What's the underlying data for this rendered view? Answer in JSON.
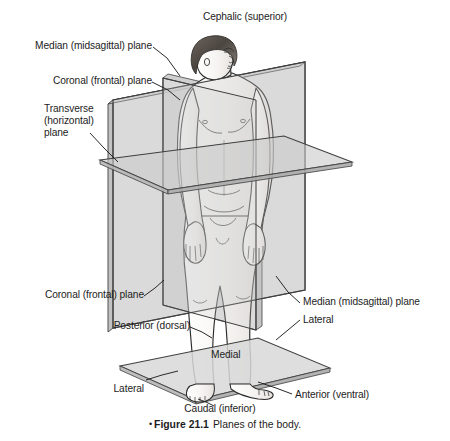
{
  "figure": {
    "caption_bullet": "•",
    "caption_number": "Figure 21.1",
    "caption_text": "Planes of the body."
  },
  "labels": {
    "cephalic": "Cephalic (superior)",
    "median_plane_top": "Median (midsagittal) plane",
    "coronal_plane_top": "Coronal (frontal) plane",
    "transverse_line1": "Transverse",
    "transverse_line2": "(horizontal)",
    "transverse_line3": "plane",
    "coronal_plane_bottom": "Coronal (frontal) plane",
    "median_plane_bottom": "Median (midsagittal) plane",
    "posterior": "Posterior (dorsal)",
    "lateral_right": "Lateral",
    "lateral_left": "Lateral",
    "medial": "Medial",
    "anterior": "Anterior (ventral)",
    "caudal": "Caudal (inferior)"
  },
  "colors": {
    "plane_fill": "#d5d5d5",
    "plane_fill_light": "#e2e2e2",
    "plane_edge": "#3a3a3a",
    "skin_fill": "#f4f2f0",
    "skin_line": "#2b2b2b",
    "hair_dark": "#4c4641",
    "hair_light": "#8d847c",
    "leader_line": "#1d1d1d",
    "text": "#1d1d1d",
    "background": "#ffffff"
  }
}
